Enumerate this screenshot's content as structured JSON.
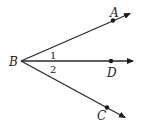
{
  "diagram": {
    "type": "geometry-angle",
    "vertex": {
      "label": "B",
      "x": 21,
      "y": 61
    },
    "rays": [
      {
        "name": "BA",
        "point_label": "A",
        "point": {
          "x": 113,
          "y": 20
        },
        "tip": {
          "x": 131,
          "y": 13
        }
      },
      {
        "name": "BD",
        "point_label": "D",
        "point": {
          "x": 111,
          "y": 61
        },
        "tip": {
          "x": 134,
          "y": 61
        }
      },
      {
        "name": "BC",
        "point_label": "C",
        "point": {
          "x": 107,
          "y": 108
        },
        "tip": {
          "x": 126,
          "y": 118
        }
      }
    ],
    "angles": [
      {
        "label": "1",
        "between": [
          "BA",
          "BD"
        ]
      },
      {
        "label": "2",
        "between": [
          "BD",
          "BC"
        ]
      }
    ],
    "labels": {
      "A": "A",
      "B": "B",
      "C": "C",
      "D": "D",
      "angle1": "1",
      "angle2": "2"
    },
    "colors": {
      "stroke": "#2a2a2a",
      "text": "#1a1a1a",
      "background": "#ffffff"
    }
  }
}
